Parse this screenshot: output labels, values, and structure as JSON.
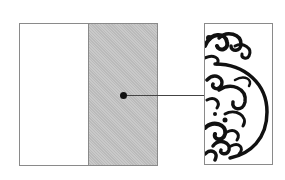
{
  "diagram": {
    "type": "section-callout",
    "panels": [
      {
        "name": "left-plain-half",
        "fill": "#ffffff"
      },
      {
        "name": "left-shaded-half",
        "fill": "#c2c2c2"
      },
      {
        "name": "detail-panel",
        "fill": "#ffffff",
        "content": "half cloud-scroll ornament"
      }
    ],
    "callout": {
      "from": "shaded-half-center",
      "to": "detail-panel"
    },
    "colors": {
      "border": "#8a8a8a",
      "shade": "#c2c2c2",
      "ink": "#111111"
    }
  }
}
